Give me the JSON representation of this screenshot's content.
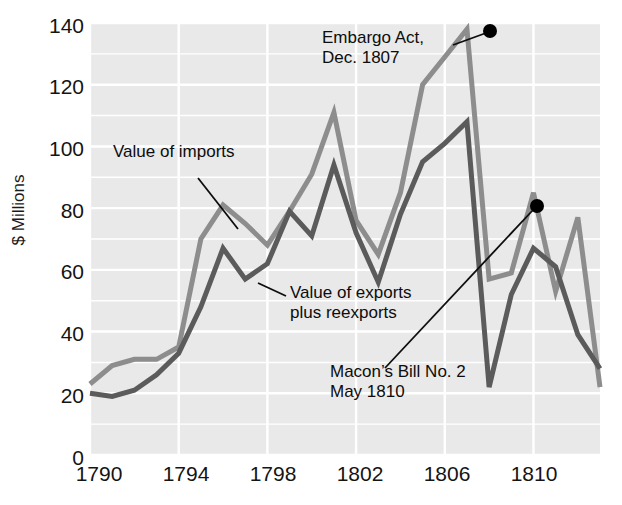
{
  "chart_data": {
    "type": "line",
    "title": "",
    "xlabel": "",
    "ylabel": "$ Millions",
    "xlim": [
      1790,
      1813
    ],
    "ylim": [
      0,
      140
    ],
    "grid": true,
    "legend_position": "inline-annotations",
    "y_ticks": [
      0,
      20,
      40,
      60,
      80,
      100,
      120,
      140
    ],
    "x_ticks": [
      1790,
      1794,
      1798,
      1802,
      1806,
      1810
    ],
    "x": [
      1790,
      1791,
      1792,
      1793,
      1794,
      1795,
      1796,
      1797,
      1798,
      1799,
      1800,
      1801,
      1802,
      1803,
      1804,
      1805,
      1806,
      1807,
      1808,
      1809,
      1810,
      1811,
      1812,
      1813
    ],
    "series": [
      {
        "name": "Value of imports",
        "color": "#8d8d8d",
        "values": [
          23,
          29,
          31,
          31,
          35,
          70,
          81,
          75,
          68,
          79,
          91,
          111,
          76,
          65,
          85,
          120,
          129,
          138,
          57,
          59,
          85,
          53,
          77,
          22
        ]
      },
      {
        "name": "Value of exports plus reexports",
        "color": "#5b5b5b",
        "values": [
          20,
          19,
          21,
          26,
          33,
          48,
          67,
          57,
          62,
          79,
          71,
          94,
          72,
          56,
          78,
          95,
          101,
          108,
          22,
          52,
          67,
          61,
          39,
          28
        ]
      }
    ],
    "annotations": [
      {
        "label": "Value of imports",
        "lines": [
          "Value of imports"
        ],
        "text_x": 113,
        "text_y": 150,
        "leader": {
          "x1": 198,
          "y1": 178,
          "x2": 238,
          "y2": 229
        }
      },
      {
        "label": "Value of exports plus reexports",
        "lines": [
          "Value of exports",
          "plus reexports"
        ],
        "text_x": 290,
        "text_y": 291,
        "leader": {
          "x1": 286,
          "y1": 296,
          "x2": 258,
          "y2": 283
        }
      },
      {
        "label": "Embargo Act, Dec. 1807",
        "lines": [
          "Embargo Act,",
          "Dec. 1807"
        ],
        "text_x": 322,
        "text_y": 34,
        "marker": {
          "x": 490,
          "y": 31
        },
        "leader": {
          "x1": 453,
          "y1": 45,
          "x2": 486,
          "y2": 33
        }
      },
      {
        "label": "Macon's Bill No. 2 May 1810",
        "lines": [
          "Macon’s Bill No. 2",
          "May 1810"
        ],
        "text_x": 330,
        "text_y": 369,
        "marker": {
          "x": 537,
          "y": 206
        },
        "leader": {
          "x1": 385,
          "y1": 368,
          "x2": 533,
          "y2": 210
        }
      }
    ]
  },
  "axis": {
    "y_label": "$ Millions",
    "y_tick_labels": [
      "140",
      "120",
      "100",
      "80",
      "60",
      "40",
      "20",
      "0"
    ],
    "x_tick_labels": [
      "1790",
      "1794",
      "1798",
      "1802",
      "1806",
      "1810"
    ]
  },
  "annotation_text": {
    "imports": "Value of imports",
    "exports_line1": "Value of exports",
    "exports_line2": "plus reexports",
    "embargo_line1": "Embargo Act,",
    "embargo_line2": "Dec. 1807",
    "macon_line1": "Macon’s Bill No. 2",
    "macon_line2": "May 1810"
  },
  "colors": {
    "imports_line": "#8d8d8d",
    "exports_line": "#5b5b5b",
    "plot_background": "#e9e9e9",
    "gridline": "#ffffff",
    "text": "#141414",
    "marker": "#000000"
  }
}
